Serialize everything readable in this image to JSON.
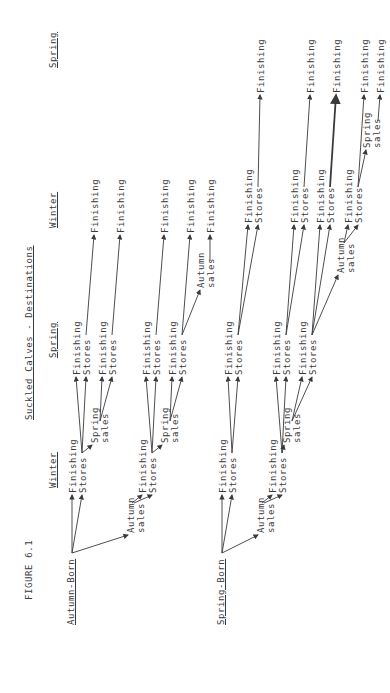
{
  "figure": {
    "label": "FIGURE 6.1",
    "title": "Suckled Calves - Destinations"
  },
  "columns": [
    "Winter",
    "Spring",
    "Winter",
    "Spring"
  ],
  "groups": [
    {
      "label": "Autumn-Born"
    },
    {
      "label": "Spring-Born"
    }
  ],
  "labels": {
    "finishing": "Finishing",
    "stores": "Stores",
    "autumn": "Autumn",
    "spring": "Spring",
    "sales": "sales"
  },
  "diagram_tree": {
    "Autumn-Born": {
      "Winter": [
        "Finishing",
        "Stores",
        "Autumn sales"
      ],
      "Stores(Winter)": [
        "Finishing (Spring)",
        "Stores (Spring)",
        "Spring sales"
      ],
      "Stores(Spring)": [
        "Finishing (Winter)"
      ],
      "Spring sales": [
        "Finishing",
        "Stores"
      ],
      "Stores(from Spring sales)": [
        "Finishing (Winter)"
      ],
      "Autumn sales": [
        "Finishing",
        "Stores"
      ],
      "Stores(from Autumn sales)": [
        "Finishing",
        "Stores",
        "Spring sales"
      ],
      "Stores(Spring, lower)": [
        "Finishing (Winter)"
      ],
      "Spring sales (lower)": [
        "Finishing",
        "Stores"
      ],
      "Stores(lower)": [
        "Finishing (Winter)",
        "Autumn sales"
      ],
      "Autumn sales (lower)": [
        "Finishing (Winter)"
      ]
    },
    "Spring-Born": {
      "Winter": [
        "Finishing",
        "Stores",
        "Autumn sales"
      ],
      "Stores(Winter)": [
        "Finishing (Spring)",
        "Stores (Spring)"
      ],
      "Stores(Spring)": [
        "Finishing (Winter)",
        "Stores (Winter)"
      ],
      "Stores(Winter 2)": [
        "Finishing (Spring)"
      ],
      "Autumn sales": [
        "Finishing",
        "Stores"
      ],
      "Stores(from Autumn sales)": [
        "Finishing",
        "Stores",
        "Spring sales"
      ],
      "Spring sales": [
        "Finishing",
        "Stores"
      ]
    }
  }
}
